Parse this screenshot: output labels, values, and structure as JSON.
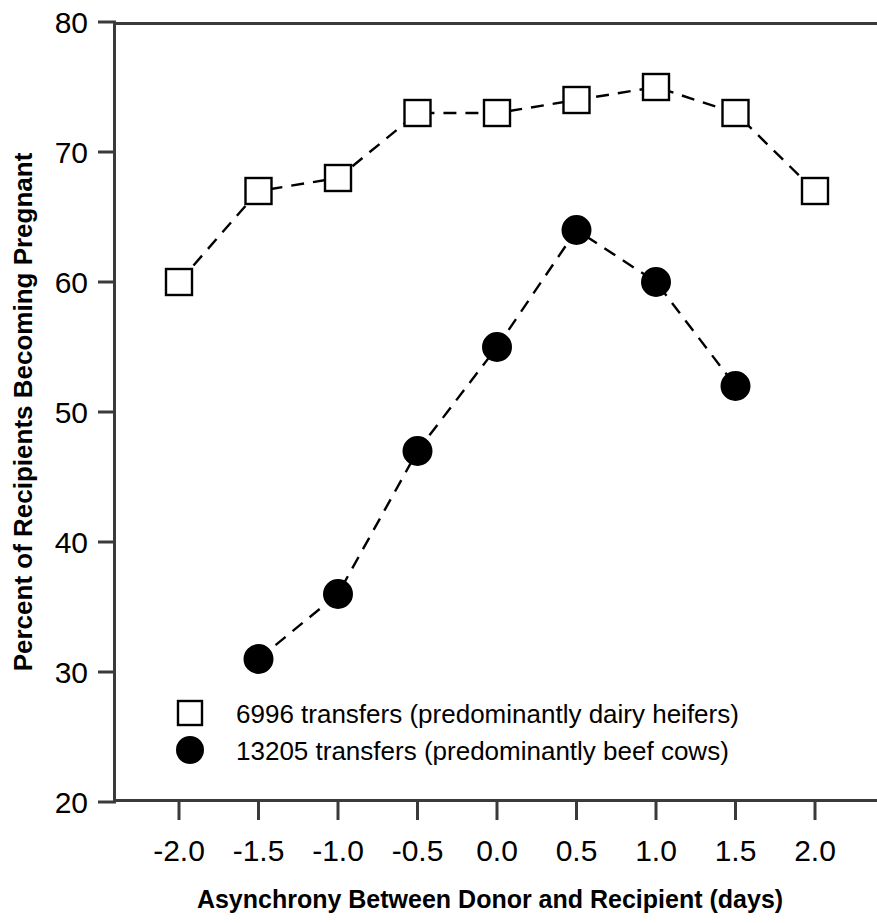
{
  "chart_data": {
    "type": "line",
    "title": "",
    "xlabel": "Asynchrony Between Donor and Recipient (days)",
    "ylabel": "Percent of Recipients Becoming Pregnant",
    "xlim": [
      -2.25,
      2.25
    ],
    "ylim": [
      20,
      80
    ],
    "xticks": [
      -2.0,
      -1.5,
      -1.0,
      -0.5,
      0.0,
      0.5,
      1.0,
      1.5,
      2.0
    ],
    "xtick_labels": [
      "-2.0",
      "-1.5",
      "-1.0",
      "-0.5",
      "0.0",
      "0.5",
      "1.0",
      "1.5",
      "2.0"
    ],
    "yticks": [
      20,
      30,
      40,
      50,
      60,
      70,
      80
    ],
    "ytick_labels": [
      "20",
      "30",
      "40",
      "50",
      "60",
      "70",
      "80"
    ],
    "grid": false,
    "legend_position": "inside-bottom-left",
    "linestyle": "dashed",
    "line_color": "#000000",
    "series": [
      {
        "name": "6996 transfers (predominantly dairy heifers)",
        "marker": "open-square",
        "marker_face": "#ffffff",
        "marker_edge": "#000000",
        "x": [
          -2.0,
          -1.5,
          -1.0,
          -0.5,
          0.0,
          0.5,
          1.0,
          1.5,
          2.0
        ],
        "values": [
          60,
          67,
          68,
          73,
          73,
          74,
          75,
          73,
          67
        ]
      },
      {
        "name": "13205 transfers (predominantly beef cows)",
        "marker": "filled-circle",
        "marker_face": "#000000",
        "marker_edge": "#000000",
        "x": [
          -1.5,
          -1.0,
          -0.5,
          0.0,
          0.5,
          1.0,
          1.5
        ],
        "values": [
          31,
          36,
          47,
          55,
          64,
          60,
          52
        ]
      }
    ]
  },
  "legend": {
    "entries": [
      {
        "marker": "open-square",
        "label": "6996 transfers (predominantly dairy heifers)"
      },
      {
        "marker": "filled-circle",
        "label": "13205 transfers (predominantly beef cows)"
      }
    ]
  },
  "axes": {
    "y_title": "Percent of Recipients Becoming Pregnant",
    "x_title": "Asynchrony Between Donor and Recipient (days)"
  },
  "colors": {
    "foreground": "#000000",
    "background": "#ffffff",
    "axis": "#3a3a3a"
  }
}
